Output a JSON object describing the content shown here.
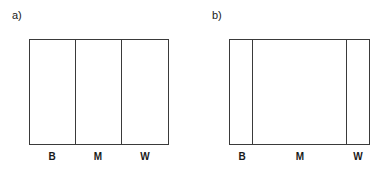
{
  "panels": [
    {
      "label": "a)",
      "segments": [
        {
          "label": "B"
        },
        {
          "label": "M"
        },
        {
          "label": "W"
        }
      ]
    },
    {
      "label": "b)",
      "segments": [
        {
          "label": "B"
        },
        {
          "label": "M"
        },
        {
          "label": "W"
        }
      ]
    }
  ]
}
